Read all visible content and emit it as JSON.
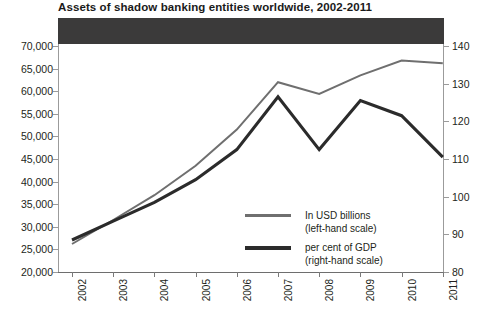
{
  "title": "Assets of shadow banking entities worldwide, 2002-2011",
  "colors": {
    "usd_line": "#6f6f6f",
    "gdp_line": "#2b2b2b",
    "axis": "#9b9b9b",
    "band": "#3b3a3a",
    "text": "#231f20"
  },
  "legend": [
    {
      "swatch": "usd-line-swatch",
      "line1": "In USD billions",
      "line2": "(left-hand scale)",
      "color": "#6f6f6f",
      "weight": "thin"
    },
    {
      "swatch": "gdp-line-swatch",
      "line1": "per cent of GDP",
      "line2": "(right-hand scale)",
      "color": "#2b2b2b",
      "weight": "thick"
    }
  ],
  "chart_data": {
    "type": "line",
    "title": "Assets of shadow banking entities worldwide, 2002-2011",
    "xlabel": "",
    "ylabel": "",
    "grid": false,
    "legend_position": "inside-lower-right",
    "categories": [
      "2002",
      "2003",
      "2004",
      "2005",
      "2006",
      "2007",
      "2008",
      "2009",
      "2010",
      "2011"
    ],
    "x_tick_labels": [
      "2002",
      "2003",
      "2004",
      "2005",
      "2006",
      "2007",
      "2008",
      "2009",
      "2010",
      "2011"
    ],
    "y_left": {
      "label": "In USD billions",
      "ylim": [
        20000,
        70000
      ],
      "ticks": [
        20000,
        25000,
        30000,
        35000,
        40000,
        45000,
        50000,
        55000,
        60000,
        65000,
        70000
      ],
      "tick_labels": [
        "20,000",
        "25,000",
        "30,000",
        "35,000",
        "40,000",
        "45,000",
        "50,000",
        "55,000",
        "60,000",
        "65,000",
        "70,000"
      ]
    },
    "y_right": {
      "label": "per cent of GDP",
      "ylim": [
        80,
        140
      ],
      "ticks": [
        80,
        90,
        100,
        110,
        120,
        130,
        140
      ],
      "tick_labels": [
        "80",
        "90",
        "100",
        "110",
        "120",
        "130",
        "140"
      ]
    },
    "series": [
      {
        "name": "In USD billions",
        "axis": "left",
        "color": "#6f6f6f",
        "values": [
          26200,
          31500,
          37000,
          43500,
          51500,
          62000,
          59400,
          63500,
          66800,
          66200
        ]
      },
      {
        "name": "per cent of GDP",
        "axis": "right",
        "color": "#2b2b2b",
        "values": [
          88.5,
          93.5,
          98.5,
          104.5,
          112.5,
          126.5,
          112.5,
          125.5,
          121.5,
          110.5
        ]
      }
    ]
  }
}
